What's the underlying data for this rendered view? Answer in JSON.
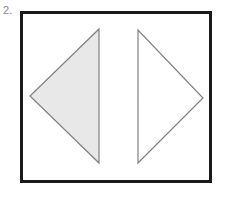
{
  "figure": {
    "item_label": "2.",
    "label_color": "#8a8a8a",
    "canvas_width": 229,
    "canvas_height": 199,
    "background_color": "#ffffff"
  },
  "frame": {
    "name": "bounding-box",
    "x": 20,
    "y": 11,
    "width": 192,
    "height": 172,
    "border_color": "#1a1a1a",
    "border_width": 3,
    "fill_color": "#ffffff"
  },
  "shapes": [
    {
      "name": "left-triangle",
      "direction": "points-left",
      "fill": "filled",
      "fill_color": "#e8e8e8",
      "stroke_color": "#808080",
      "stroke_width": 1.2,
      "points": "99,29 99,163 30,96"
    },
    {
      "name": "right-triangle",
      "direction": "points-right",
      "fill": "unfilled",
      "fill_color": "#ffffff",
      "stroke_color": "#808080",
      "stroke_width": 1.2,
      "points": "138,30 138,163 203,98"
    }
  ]
}
